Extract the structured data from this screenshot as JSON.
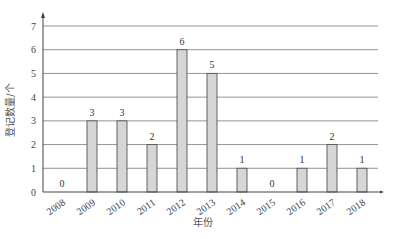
{
  "chart_data": {
    "type": "bar",
    "title": "",
    "xlabel": "年份",
    "ylabel": "登记数量/个",
    "categories": [
      "2008",
      "2009",
      "2010",
      "2011",
      "2012",
      "2013",
      "2014",
      "2015",
      "2016",
      "2017",
      "2018"
    ],
    "values": [
      0,
      3,
      3,
      2,
      6,
      5,
      1,
      0,
      1,
      2,
      1
    ],
    "data_labels": [
      "0",
      "3",
      "3",
      "2",
      "6",
      "5",
      "1",
      "0",
      "1",
      "2",
      "1"
    ],
    "yticks": [
      "0",
      "1",
      "2",
      "3",
      "4",
      "5",
      "6",
      "7"
    ],
    "ylim": [
      0,
      7
    ],
    "grid": true,
    "legend": null,
    "colors": {
      "bar_fill": "#d6d6d6",
      "bar_stroke": "#555555",
      "grid": "#888888"
    }
  }
}
